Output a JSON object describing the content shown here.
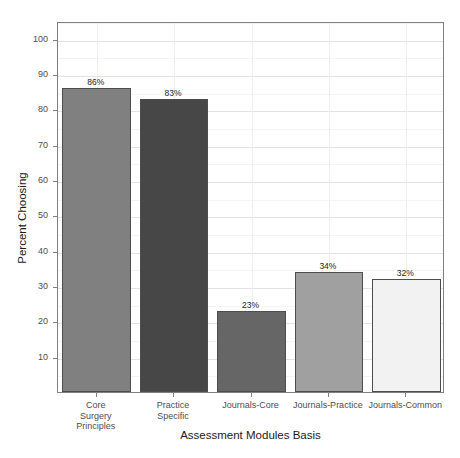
{
  "chart_data": {
    "type": "bar",
    "title": "",
    "xlabel": "Assessment Modules Basis",
    "ylabel": "Percent Choosing",
    "categories": [
      "Core\nSurgery\nPrinciples",
      "Practice\nSpecific",
      "Journals-Core",
      "Journals-Practice",
      "Journals-Common"
    ],
    "values": [
      86,
      83,
      23,
      34,
      32
    ],
    "data_labels": [
      "86%",
      "83%",
      "23%",
      "34%",
      "32%"
    ],
    "bar_colors": [
      "#808080",
      "#474747",
      "#666666",
      "#a0a0a0",
      "#f2f2f2"
    ],
    "bar_border_color": "#4d4d4d",
    "ylim": [
      0,
      105
    ],
    "y_major_ticks": [
      10,
      20,
      30,
      40,
      50,
      60,
      70,
      80,
      90,
      100
    ],
    "y_tick_labels": [
      "10",
      "20",
      "30",
      "40",
      "50",
      "60",
      "70",
      "80",
      "90",
      "100"
    ],
    "y_minor_ticks": [
      5,
      15,
      25,
      35,
      45,
      55,
      65,
      75,
      85,
      95,
      105
    ],
    "grid": true,
    "grid_major_color": "#e3e3e3",
    "grid_minor_color": "#f4f4f4",
    "legend": "none",
    "panel_border_color": "#808080",
    "background": "#ffffff"
  }
}
